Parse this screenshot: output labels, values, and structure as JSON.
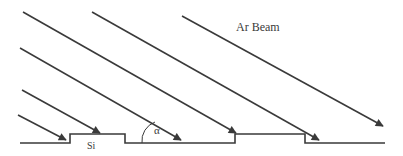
{
  "labels": {
    "beam": "Ar Beam",
    "material": "Si",
    "angle": "α"
  },
  "colors": {
    "line": "#3a3a3a",
    "background": "#ffffff"
  },
  "surface_profile": [
    [
      20,
      143
    ],
    [
      70,
      143
    ],
    [
      70,
      134
    ],
    [
      125,
      134
    ],
    [
      125,
      143
    ],
    [
      235,
      143
    ],
    [
      235,
      134
    ],
    [
      305,
      134
    ],
    [
      305,
      143
    ],
    [
      385,
      143
    ]
  ],
  "beam_arrows": [
    {
      "x1": 18,
      "y1": 115,
      "x2": 66,
      "y2": 140
    },
    {
      "x1": 22,
      "y1": 90,
      "x2": 100,
      "y2": 133
    },
    {
      "x1": 20,
      "y1": 48,
      "x2": 181,
      "y2": 140
    },
    {
      "x1": 23,
      "y1": 12,
      "x2": 236,
      "y2": 133
    },
    {
      "x1": 92,
      "y1": 12,
      "x2": 319,
      "y2": 140
    },
    {
      "x1": 182,
      "y1": 16,
      "x2": 383,
      "y2": 126
    }
  ]
}
